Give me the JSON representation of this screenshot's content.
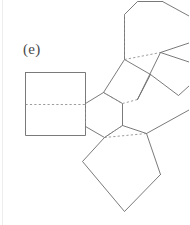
{
  "figure": {
    "label": "(e)",
    "caption_letter": "e",
    "background_color": "#ffffff",
    "stroke_color": "#6b6b6b",
    "dashed_stroke_color": "#8a8a8a",
    "label_color": "#4a4a4a",
    "page_edge_color": "#ececec",
    "stroke_width": 0.9,
    "dash_pattern": "2.2 2.2",
    "canvas": {
      "width": 189,
      "height": 225
    },
    "geometry": {
      "solid_polylines": [
        "25.5,72.5 85.5,72.5 85.5,135.5 25.5,135.5 25.5,72.5",
        "85.5,103.5 103.5,92.5 122.5,103.5 122.5,125.5 104.5,137.5 85.5,126.5",
        "103.5,92.5 124.5,59.5 150.5,74.5 137.5,99.5",
        "124.5,59.5 124.5,14.5 137.5,1.5 162.5,1.5",
        "137.5,99.5 160.5,52.5",
        "160.5,52.5 189,43",
        "160.5,52.5 189,62",
        "122.5,125.5 146.5,133.5 189,110",
        "104.5,137.5 82.5,161.5 124.5,211.5 160.5,174.5",
        "146.5,133.5 160.5,174.5",
        "150.5,74.5 178.5,95.5 189,86",
        "162.5,1.5 189,16"
      ],
      "dashed_polylines": [
        "25.5,104.5 85.5,104.5",
        "85.5,103.5 85.5,126.5",
        "103.5,92.5 122.5,103.5",
        "122.5,103.5 137.5,99.5",
        "124.5,59.5 160.5,52.5",
        "104.5,137.5 146.5,133.5",
        "104.5,137.5 122.5,125.5",
        "124.5,14.5 124.5,59.5"
      ]
    }
  }
}
